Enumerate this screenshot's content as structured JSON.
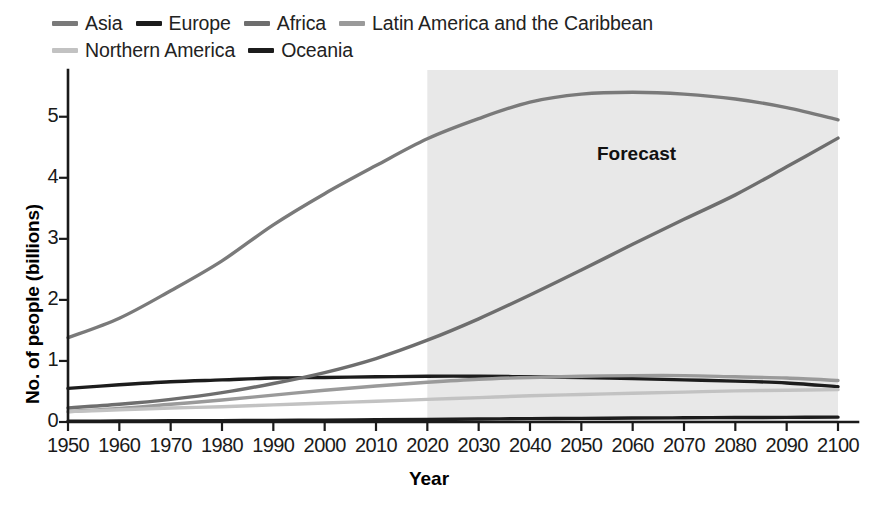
{
  "chart_data": {
    "type": "line",
    "title": "",
    "xlabel": "Year",
    "ylabel": "No. of people (billions)",
    "xlim": [
      1950,
      2100
    ],
    "ylim": [
      0,
      5.7
    ],
    "xticks": [
      "1950",
      "1960",
      "1970",
      "1980",
      "1990",
      "2000",
      "2010",
      "2020",
      "2030",
      "2040",
      "2050",
      "2060",
      "2070",
      "2080",
      "2090",
      "2100"
    ],
    "yticks": [
      "0",
      "1",
      "2",
      "3",
      "4",
      "5"
    ],
    "grid": false,
    "legend_position": "top-left",
    "x": [
      1950,
      1960,
      1970,
      1980,
      1990,
      2000,
      2010,
      2020,
      2030,
      2040,
      2050,
      2060,
      2070,
      2080,
      2090,
      2100
    ],
    "annotations": [
      {
        "label": "Forecast",
        "type": "shaded-region",
        "x_start": 2020,
        "x_end": 2100,
        "color": "#e8e8e8"
      }
    ],
    "series": [
      {
        "name": "Asia",
        "color": "#7a7a7a",
        "width": 3.4,
        "values": [
          1.38,
          1.7,
          2.15,
          2.64,
          3.23,
          3.74,
          4.2,
          4.64,
          4.97,
          5.24,
          5.37,
          5.4,
          5.37,
          5.29,
          5.15,
          4.95
        ]
      },
      {
        "name": "Europe",
        "color": "#1c1c1c",
        "width": 3.4,
        "values": [
          0.55,
          0.61,
          0.66,
          0.69,
          0.72,
          0.73,
          0.74,
          0.75,
          0.75,
          0.74,
          0.73,
          0.71,
          0.69,
          0.67,
          0.64,
          0.58
        ]
      },
      {
        "name": "Africa",
        "color": "#6e6e6e",
        "width": 3.4,
        "values": [
          0.23,
          0.29,
          0.37,
          0.48,
          0.63,
          0.81,
          1.04,
          1.34,
          1.69,
          2.08,
          2.49,
          2.91,
          3.32,
          3.72,
          4.18,
          4.65
        ]
      },
      {
        "name": "Latin America and the Caribbean",
        "color": "#9a9a9a",
        "width": 3.4,
        "values": [
          0.17,
          0.22,
          0.29,
          0.36,
          0.44,
          0.52,
          0.59,
          0.65,
          0.7,
          0.73,
          0.75,
          0.76,
          0.76,
          0.74,
          0.72,
          0.68
        ]
      },
      {
        "name": "Northern America",
        "color": "#c2c2c2",
        "width": 3.4,
        "values": [
          0.17,
          0.2,
          0.23,
          0.25,
          0.28,
          0.31,
          0.34,
          0.37,
          0.4,
          0.43,
          0.45,
          0.47,
          0.49,
          0.51,
          0.52,
          0.53
        ]
      },
      {
        "name": "Oceania",
        "color": "#1c1c1c",
        "width": 3.4,
        "values": [
          0.013,
          0.016,
          0.02,
          0.023,
          0.027,
          0.031,
          0.037,
          0.043,
          0.049,
          0.055,
          0.06,
          0.065,
          0.069,
          0.073,
          0.076,
          0.08
        ]
      }
    ]
  },
  "legend": {
    "rows": [
      [
        {
          "label": "Asia",
          "color": "#7a7a7a"
        },
        {
          "label": "Europe",
          "color": "#1c1c1c"
        },
        {
          "label": "Africa",
          "color": "#6e6e6e"
        },
        {
          "label": "Latin America and the Caribbean",
          "color": "#9a9a9a"
        }
      ],
      [
        {
          "label": "Northern America",
          "color": "#c2c2c2"
        },
        {
          "label": "Oceania",
          "color": "#1c1c1c"
        }
      ]
    ]
  },
  "forecast": {
    "label": "Forecast"
  }
}
